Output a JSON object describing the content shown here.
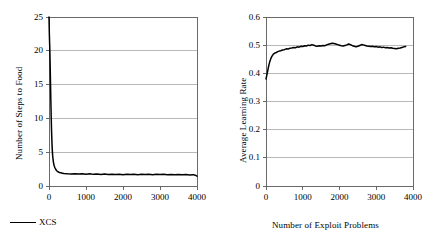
{
  "figure": {
    "background": "#ffffff",
    "line_color": "#000000",
    "grid_color": "#9a9a9a",
    "axis_color": "#5a5a5a"
  },
  "chart_data": [
    {
      "id": "steps-to-food",
      "type": "line",
      "title": "",
      "xlabel": "",
      "ylabel": "Number of Steps to Food",
      "xlim": [
        0,
        4000
      ],
      "ylim": [
        0,
        25
      ],
      "xticks": [
        "0",
        "1000",
        "2000",
        "3000",
        "4000"
      ],
      "xtick_values": [
        0,
        1000,
        2000,
        3000,
        4000
      ],
      "yticks": [
        "0",
        "5",
        "10",
        "15",
        "20",
        "25"
      ],
      "ytick_values": [
        0,
        5,
        10,
        15,
        20,
        25
      ],
      "grid": "horizontal",
      "legend": [
        {
          "label": "XCS",
          "marker": "line"
        }
      ],
      "legend_position": "below-left",
      "series": [
        {
          "name": "XCS",
          "x": [
            0,
            10,
            20,
            30,
            40,
            50,
            60,
            70,
            80,
            90,
            100,
            120,
            140,
            160,
            180,
            200,
            240,
            280,
            320,
            360,
            400,
            500,
            600,
            700,
            800,
            900,
            1000,
            1100,
            1200,
            1300,
            1400,
            1500,
            1600,
            1700,
            1800,
            1900,
            2000,
            2100,
            2200,
            2300,
            2400,
            2500,
            2600,
            2700,
            2800,
            2900,
            3000,
            3100,
            3200,
            3300,
            3400,
            3500,
            3600,
            3700,
            3800,
            3900,
            3950,
            4000
          ],
          "values": [
            25.0,
            22.4,
            20.6,
            18.2,
            15.4,
            12.6,
            10.1,
            8.0,
            6.4,
            5.2,
            4.4,
            3.5,
            3.0,
            2.7,
            2.5,
            2.3,
            2.1,
            2.0,
            1.95,
            1.9,
            1.85,
            1.8,
            1.78,
            1.8,
            1.76,
            1.8,
            1.74,
            1.8,
            1.72,
            1.78,
            1.7,
            1.76,
            1.7,
            1.74,
            1.7,
            1.75,
            1.68,
            1.74,
            1.7,
            1.73,
            1.68,
            1.72,
            1.7,
            1.74,
            1.68,
            1.72,
            1.7,
            1.73,
            1.68,
            1.7,
            1.66,
            1.7,
            1.65,
            1.7,
            1.64,
            1.68,
            1.6,
            1.45
          ]
        }
      ]
    },
    {
      "id": "average-learning-rate",
      "type": "line",
      "title": "",
      "xlabel": "Number of Exploit Problems",
      "ylabel": "Average Learning Rate",
      "xlim": [
        0,
        4000
      ],
      "ylim": [
        0,
        0.6
      ],
      "xticks": [
        "0",
        "1000",
        "2000",
        "3000",
        "4000"
      ],
      "xtick_values": [
        0,
        1000,
        2000,
        3000,
        4000
      ],
      "yticks": [
        "0",
        "0.1",
        "0.2",
        "0.3",
        "0.4",
        "0.5",
        "0.6"
      ],
      "ytick_values": [
        0,
        0.1,
        0.2,
        0.3,
        0.4,
        0.5,
        0.6
      ],
      "grid": "horizontal",
      "legend": [],
      "series": [
        {
          "name": "XCS",
          "x": [
            0,
            20,
            40,
            60,
            80,
            100,
            130,
            160,
            200,
            240,
            280,
            320,
            360,
            400,
            450,
            500,
            550,
            600,
            650,
            700,
            750,
            800,
            850,
            900,
            950,
            1000,
            1050,
            1100,
            1150,
            1200,
            1250,
            1300,
            1350,
            1400,
            1450,
            1500,
            1550,
            1600,
            1650,
            1700,
            1750,
            1800,
            1850,
            1900,
            1950,
            2000,
            2050,
            2100,
            2150,
            2200,
            2250,
            2300,
            2350,
            2400,
            2450,
            2500,
            2550,
            2600,
            2650,
            2700,
            2750,
            2800,
            2850,
            2900,
            2950,
            3000,
            3050,
            3100,
            3150,
            3200,
            3250,
            3300,
            3350,
            3400,
            3450,
            3500,
            3550,
            3600,
            3650,
            3700,
            3750,
            3800
          ],
          "values": [
            0.38,
            0.392,
            0.404,
            0.418,
            0.43,
            0.44,
            0.452,
            0.46,
            0.468,
            0.472,
            0.474,
            0.477,
            0.479,
            0.48,
            0.483,
            0.484,
            0.487,
            0.486,
            0.489,
            0.49,
            0.492,
            0.491,
            0.494,
            0.493,
            0.496,
            0.495,
            0.498,
            0.497,
            0.5,
            0.499,
            0.502,
            0.5,
            0.497,
            0.496,
            0.498,
            0.497,
            0.499,
            0.498,
            0.501,
            0.503,
            0.505,
            0.507,
            0.506,
            0.504,
            0.502,
            0.5,
            0.498,
            0.497,
            0.499,
            0.501,
            0.504,
            0.502,
            0.498,
            0.496,
            0.494,
            0.496,
            0.499,
            0.502,
            0.501,
            0.499,
            0.497,
            0.496,
            0.495,
            0.496,
            0.494,
            0.495,
            0.493,
            0.494,
            0.492,
            0.493,
            0.491,
            0.492,
            0.49,
            0.491,
            0.489,
            0.488,
            0.487,
            0.489,
            0.49,
            0.492,
            0.494,
            0.495
          ]
        }
      ]
    }
  ]
}
